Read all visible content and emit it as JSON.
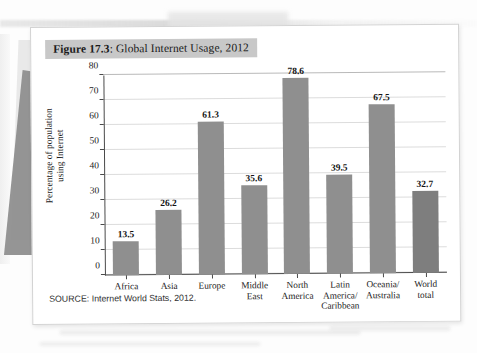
{
  "figure": {
    "title_number": "Figure 17.3",
    "title_rest": ": Global Internet Usage, 2012",
    "source": "SOURCE: Internet World Stats, 2012."
  },
  "chart_data": {
    "type": "bar",
    "title": "Figure 17.3: Global Internet Usage, 2012",
    "xlabel": "",
    "ylabel": "Percentage of population using Internet",
    "ylabel_line1": "Percentage of population",
    "ylabel_line2": "using Internet",
    "categories": [
      "Africa",
      "Asia",
      "Europe",
      "Middle East",
      "North America",
      "Latin America/ Caribbean",
      "Oceania/ Australia",
      "World total"
    ],
    "category_lines": [
      [
        "Africa"
      ],
      [
        "Asia"
      ],
      [
        "Europe"
      ],
      [
        "Middle",
        "East"
      ],
      [
        "North",
        "America"
      ],
      [
        "Latin",
        "America/",
        "Caribbean"
      ],
      [
        "Oceania/",
        "Australia"
      ],
      [
        "World",
        "total"
      ]
    ],
    "values": [
      13.5,
      26.2,
      61.3,
      35.6,
      78.6,
      39.5,
      67.5,
      32.7
    ],
    "value_labels": [
      "13.5",
      "26.2",
      "61.3",
      "35.6",
      "78.6",
      "39.5",
      "67.5",
      "32.7"
    ],
    "ylim": [
      0,
      80
    ],
    "ytick_values": [
      0,
      10,
      20,
      30,
      40,
      50,
      60,
      70,
      80
    ],
    "ytick_labels": [
      "0",
      "10",
      "20",
      "30",
      "40",
      "50",
      "60",
      "70",
      "80"
    ],
    "grid": true,
    "legend": "none",
    "bar_color": "#8f8f8f",
    "bar_color_last": "#7e7e7e",
    "source_note": "SOURCE: Internet World Stats, 2012."
  }
}
